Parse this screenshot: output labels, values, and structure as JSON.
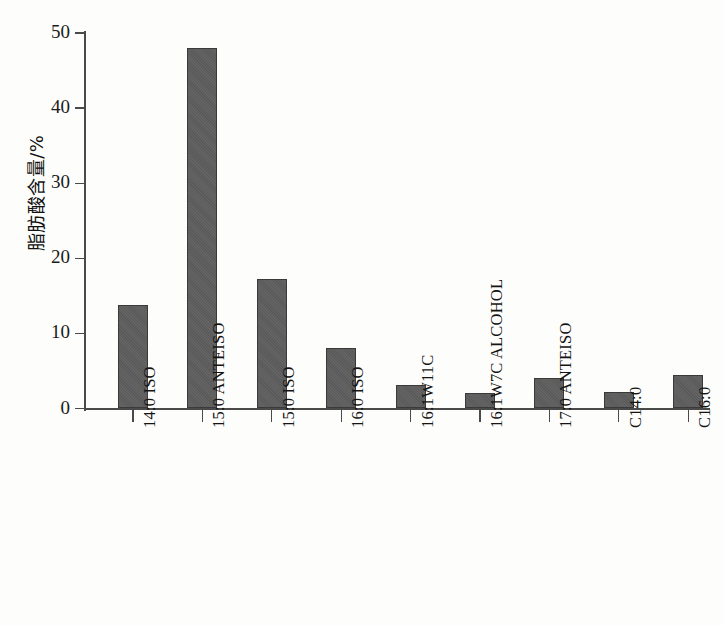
{
  "chart_data": {
    "type": "bar",
    "title": "",
    "xlabel": "",
    "ylabel": "脂肪酸含量/%",
    "ylim": [
      0,
      50
    ],
    "yticks": [
      0,
      10,
      20,
      30,
      40,
      50
    ],
    "grid": false,
    "legend": "none",
    "bar_color": "#5d5d5d",
    "bar_edge_color": "#3a3a3a",
    "categories": [
      "14:0 ISO",
      "15:0 ANTEISO",
      "15:0 ISO",
      "16:0 ISO",
      "16:1W11C",
      "16:1W7C ALCOHOL",
      "17:0 ANTEISO",
      "C14:0",
      "C16:0"
    ],
    "values": [
      13.8,
      48.0,
      17.2,
      8.0,
      3.1,
      2.1,
      4.1,
      2.2,
      4.5
    ]
  },
  "axis": {
    "y_tick_labels": [
      "0",
      "10",
      "20",
      "30",
      "40",
      "50"
    ]
  }
}
